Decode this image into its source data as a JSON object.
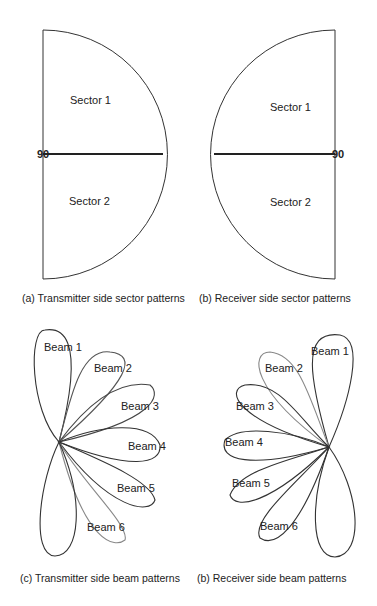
{
  "figures": {
    "a": {
      "caption": "(a) Transmitter side sector patterns",
      "sectors": [
        "Sector 1",
        "Sector 2"
      ],
      "marker": "90"
    },
    "b": {
      "caption": "(b) Receiver side sector patterns",
      "sectors": [
        "Sector 1",
        "Sector 2"
      ],
      "marker": "90"
    },
    "c": {
      "caption": "(c) Transmitter side beam patterns",
      "beams": [
        "Beam 1",
        "Beam 2",
        "Beam 3",
        "Beam 4",
        "Beam 5",
        "Beam 6"
      ]
    },
    "d": {
      "caption": "(b) Receiver side beam patterns",
      "beams": [
        "Beam 1",
        "Beam 2",
        "Beam 3",
        "Beam 4",
        "Beam 5",
        "Beam 6"
      ]
    }
  },
  "colors": {
    "line": "#222222",
    "light_line": "#888888"
  }
}
